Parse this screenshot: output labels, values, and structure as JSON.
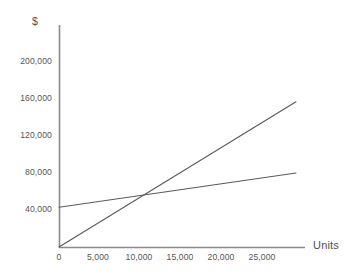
{
  "chart_data": {
    "type": "line",
    "title": "",
    "xlabel": "Units",
    "ylabel": "$",
    "xlim": [
      0,
      27000
    ],
    "ylim": [
      0,
      220000
    ],
    "grid": false,
    "legend": "none",
    "xticks": [
      0,
      5000,
      10000,
      15000,
      20000,
      25000
    ],
    "xticklabels": [
      "0",
      "5,000",
      "10,000",
      "15,000",
      "20,000",
      "25,000"
    ],
    "yticks": [
      40000,
      80000,
      120000,
      160000,
      200000
    ],
    "yticklabels": [
      "40,000",
      "80,000",
      "120,000",
      "160,000",
      "200,000"
    ],
    "series": [
      {
        "name": "total-cost-line",
        "x": [
          0,
          27000
        ],
        "values": [
          43000,
          80000
        ],
        "color": "#5a5a5a"
      },
      {
        "name": "revenue-line",
        "x": [
          0,
          27000
        ],
        "values": [
          0,
          157000
        ],
        "color": "#5a5a5a"
      }
    ],
    "annotations": []
  },
  "axes": {
    "y_title": "$",
    "x_title": "Units"
  },
  "colors": {
    "axis": "#808080",
    "line": "#5a5a5a",
    "text": "#555555",
    "background": "#ffffff"
  }
}
